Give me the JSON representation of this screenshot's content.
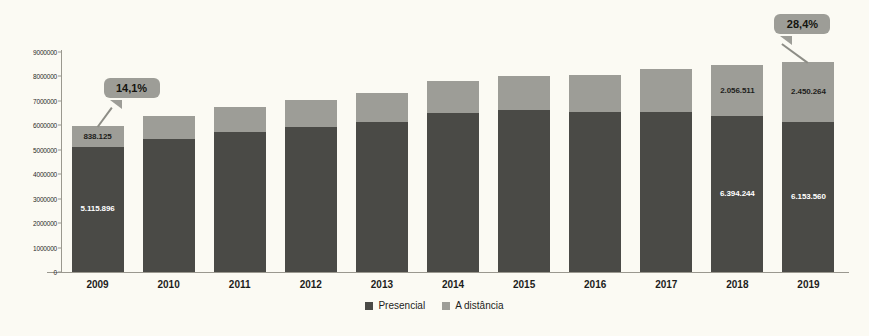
{
  "chart_data": {
    "type": "bar",
    "subtype": "stacked-vertical",
    "title": "",
    "xlabel": "",
    "ylabel": "",
    "ylim": [
      0,
      9000000
    ],
    "ytick_step": 1000000,
    "grid": false,
    "legend_position": "bottom-center",
    "categories": [
      "2009",
      "2010",
      "2011",
      "2012",
      "2013",
      "2014",
      "2015",
      "2016",
      "2017",
      "2018",
      "2019"
    ],
    "series": [
      {
        "name": "Presencial",
        "color": "#4a4a46",
        "values": [
          5115896,
          5449120,
          5746762,
          5923838,
          6152405,
          6486171,
          6633545,
          6554283,
          6529681,
          6394244,
          6153560
        ]
      },
      {
        "name": "A distância",
        "color": "#9d9d97",
        "values": [
          838125,
          930179,
          992927,
          1113850,
          1153572,
          1341842,
          1393752,
          1494418,
          1756982,
          2056511,
          2450264
        ]
      }
    ],
    "ytick_labels": [
      "0",
      "1000000",
      "2000000",
      "3000000",
      "4000000",
      "5000000",
      "6000000",
      "7000000",
      "8000000",
      "9000000"
    ],
    "value_labels": [
      {
        "category": "2009",
        "series": "A distância",
        "text": "838.125"
      },
      {
        "category": "2009",
        "series": "Presencial",
        "text": "5.115.896"
      },
      {
        "category": "2018",
        "series": "A distância",
        "text": "2.056.511"
      },
      {
        "category": "2018",
        "series": "Presencial",
        "text": "6.394.244"
      },
      {
        "category": "2019",
        "series": "A distância",
        "text": "2.450.264"
      },
      {
        "category": "2019",
        "series": "Presencial",
        "text": "6.153.560"
      }
    ],
    "annotations": [
      {
        "category": "2009",
        "text": "14,1%",
        "type": "callout"
      },
      {
        "category": "2019",
        "text": "28,4%",
        "type": "callout"
      }
    ]
  },
  "legend": {
    "items": [
      {
        "label": "Presencial",
        "color": "#4a4a46"
      },
      {
        "label": "A distância",
        "color": "#9d9d97"
      }
    ]
  },
  "colors": {
    "presencial": "#4a4a46",
    "distancia": "#9d9d97",
    "background": "#fbfaf3",
    "axis": "#9a988f",
    "callout_fill": "#9d9d97"
  }
}
